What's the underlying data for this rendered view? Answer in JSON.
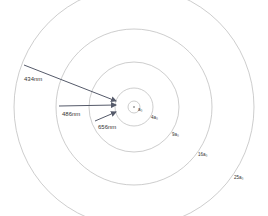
{
  "diagram": {
    "center": [
      134,
      107
    ],
    "orbits": [
      {
        "n": 1,
        "label": "a₀",
        "r": 6,
        "label_pos": [
          138,
          107
        ]
      },
      {
        "n": 2,
        "label": "4a₀",
        "r": 19,
        "label_pos": [
          151,
          115
        ]
      },
      {
        "n": 3,
        "label": "9a₀",
        "r": 45,
        "label_pos": [
          172,
          132
        ]
      },
      {
        "n": 4,
        "label": "16a₀",
        "r": 78,
        "label_pos": [
          198,
          152
        ]
      },
      {
        "n": 5,
        "label": "25a₀",
        "r": 120,
        "label_pos": [
          234,
          175
        ]
      }
    ],
    "transitions": [
      {
        "label": "434nm",
        "from_n": 5,
        "to_n": 2,
        "x1": 24,
        "y1": 65,
        "x2": 116,
        "y2": 101,
        "label_pos": [
          24,
          76
        ]
      },
      {
        "label": "486nm",
        "from_n": 4,
        "to_n": 2,
        "x1": 59,
        "y1": 106,
        "x2": 116,
        "y2": 105,
        "label_pos": [
          62,
          111
        ]
      },
      {
        "label": "656nm",
        "from_n": 3,
        "to_n": 2,
        "x1": 95,
        "y1": 121,
        "x2": 116,
        "y2": 112,
        "label_pos": [
          98,
          124
        ]
      }
    ],
    "colors": {
      "orbit": "#b8b8b8",
      "arrow": "#555a6a",
      "text": "#333333"
    }
  }
}
